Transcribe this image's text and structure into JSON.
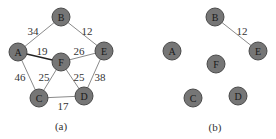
{
  "panels": [
    {
      "caption": "(a)",
      "nodes": [
        {
          "id": "A",
          "x": 18,
          "y": 52
        },
        {
          "id": "B",
          "x": 61,
          "y": 17
        },
        {
          "id": "E",
          "x": 104,
          "y": 51
        },
        {
          "id": "F",
          "x": 61,
          "y": 62
        },
        {
          "id": "C",
          "x": 39,
          "y": 98
        },
        {
          "id": "D",
          "x": 84,
          "y": 96
        }
      ],
      "edges": [
        {
          "from": "A",
          "to": "B",
          "weight": "34",
          "lx": 33,
          "ly": 31,
          "bold": false
        },
        {
          "from": "B",
          "to": "E",
          "weight": "12",
          "lx": 87,
          "ly": 31,
          "bold": false
        },
        {
          "from": "A",
          "to": "F",
          "weight": "19",
          "lx": 42,
          "ly": 51,
          "bold": true
        },
        {
          "from": "F",
          "to": "E",
          "weight": "26",
          "lx": 79,
          "ly": 51,
          "bold": false
        },
        {
          "from": "A",
          "to": "C",
          "weight": "46",
          "lx": 20,
          "ly": 77,
          "bold": false
        },
        {
          "from": "F",
          "to": "C",
          "weight": "25",
          "lx": 44,
          "ly": 77,
          "bold": false
        },
        {
          "from": "F",
          "to": "D",
          "weight": "25",
          "lx": 79,
          "ly": 77,
          "bold": false
        },
        {
          "from": "E",
          "to": "D",
          "weight": "38",
          "lx": 100,
          "ly": 77,
          "bold": false
        },
        {
          "from": "C",
          "to": "D",
          "weight": "17",
          "lx": 63,
          "ly": 106,
          "bold": false
        }
      ],
      "caption_x": 61,
      "caption_y": 126
    },
    {
      "caption": "(b)",
      "nodes": [
        {
          "id": "A",
          "x": 172,
          "y": 51
        },
        {
          "id": "B",
          "x": 215,
          "y": 17
        },
        {
          "id": "E",
          "x": 258,
          "y": 51
        },
        {
          "id": "F",
          "x": 216,
          "y": 64
        },
        {
          "id": "C",
          "x": 193,
          "y": 98
        },
        {
          "id": "D",
          "x": 238,
          "y": 96
        }
      ],
      "edges": [
        {
          "from": "B",
          "to": "E",
          "weight": "12",
          "lx": 242,
          "ly": 31,
          "bold": false
        }
      ],
      "caption_x": 215,
      "caption_y": 127
    }
  ],
  "node_radius": 9,
  "colors": {
    "node_fill": "#767676",
    "node_stroke": "#4a4a4a",
    "edge": "#8a8a8a",
    "edge_highlight": "#222222"
  }
}
